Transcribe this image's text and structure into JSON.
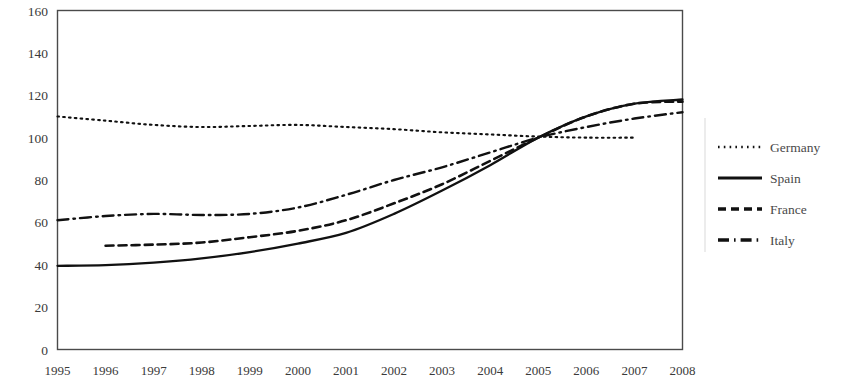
{
  "chart_data": {
    "type": "line",
    "title": "",
    "subtitle": "",
    "xlabel": "",
    "ylabel": "",
    "x": [
      1995,
      1996,
      1997,
      1998,
      1999,
      2000,
      2001,
      2002,
      2003,
      2004,
      2005,
      2006,
      2007,
      2008
    ],
    "categories": [
      "1995",
      "1996",
      "1997",
      "1998",
      "1999",
      "2000",
      "2001",
      "2002",
      "2003",
      "2004",
      "2005",
      "2006",
      "2007",
      "2008"
    ],
    "xlim": [
      1995,
      2008
    ],
    "ylim": [
      0,
      160
    ],
    "yticks": [
      0,
      20,
      40,
      60,
      80,
      100,
      120,
      140,
      160
    ],
    "ytick_labels": [
      "0",
      "20",
      "40",
      "60",
      "80",
      "100",
      "120",
      "140",
      "160"
    ],
    "grid": false,
    "legend_position": "right",
    "series": [
      {
        "name": "Germany",
        "style": "dotted",
        "color": "#111111",
        "x": [
          1995,
          1996,
          1997,
          1998,
          1999,
          2000,
          2001,
          2002,
          2003,
          2004,
          2005,
          2006,
          2007
        ],
        "values": [
          110,
          108,
          106,
          105,
          105.5,
          106,
          105,
          104,
          102.5,
          101.5,
          100.5,
          100,
          100
        ]
      },
      {
        "name": "Spain",
        "style": "solid",
        "color": "#111111",
        "x": [
          1995,
          1996,
          1997,
          1998,
          1999,
          2000,
          2001,
          2002,
          2003,
          2004,
          2005,
          2006,
          2007,
          2008
        ],
        "values": [
          39.5,
          39.8,
          41,
          43,
          46,
          50,
          55,
          64,
          75,
          87,
          100,
          110,
          116,
          118
        ]
      },
      {
        "name": "France",
        "style": "dashed",
        "color": "#111111",
        "x": [
          1996,
          1997,
          1998,
          1999,
          2000,
          2001,
          2002,
          2003,
          2004,
          2005,
          2006,
          2007,
          2008
        ],
        "values": [
          49,
          49.5,
          50.5,
          53,
          56,
          61,
          69,
          78,
          89,
          100,
          110,
          116,
          117
        ]
      },
      {
        "name": "Italy",
        "style": "dashdot",
        "color": "#111111",
        "x": [
          1995,
          1996,
          1997,
          1998,
          1999,
          2000,
          2001,
          2002,
          2003,
          2004,
          2005,
          2006,
          2007,
          2008
        ],
        "values": [
          61,
          63,
          64,
          63.5,
          64,
          67,
          73,
          80,
          86,
          93,
          100,
          105,
          109,
          112
        ]
      }
    ]
  },
  "legend": {
    "entries": [
      {
        "label": "Germany",
        "style": "dotted"
      },
      {
        "label": "Spain",
        "style": "solid"
      },
      {
        "label": "France",
        "style": "dashed"
      },
      {
        "label": "Italy",
        "style": "dashdot"
      }
    ]
  },
  "axes": {
    "y_tick_labels": [
      "160",
      "140",
      "120",
      "100",
      "80",
      "60",
      "40",
      "20",
      "0"
    ],
    "x_tick_labels": [
      "1995",
      "1996",
      "1997",
      "1998",
      "1999",
      "2000",
      "2001",
      "2002",
      "2003",
      "2004",
      "2005",
      "2006",
      "2007",
      "2008"
    ]
  }
}
